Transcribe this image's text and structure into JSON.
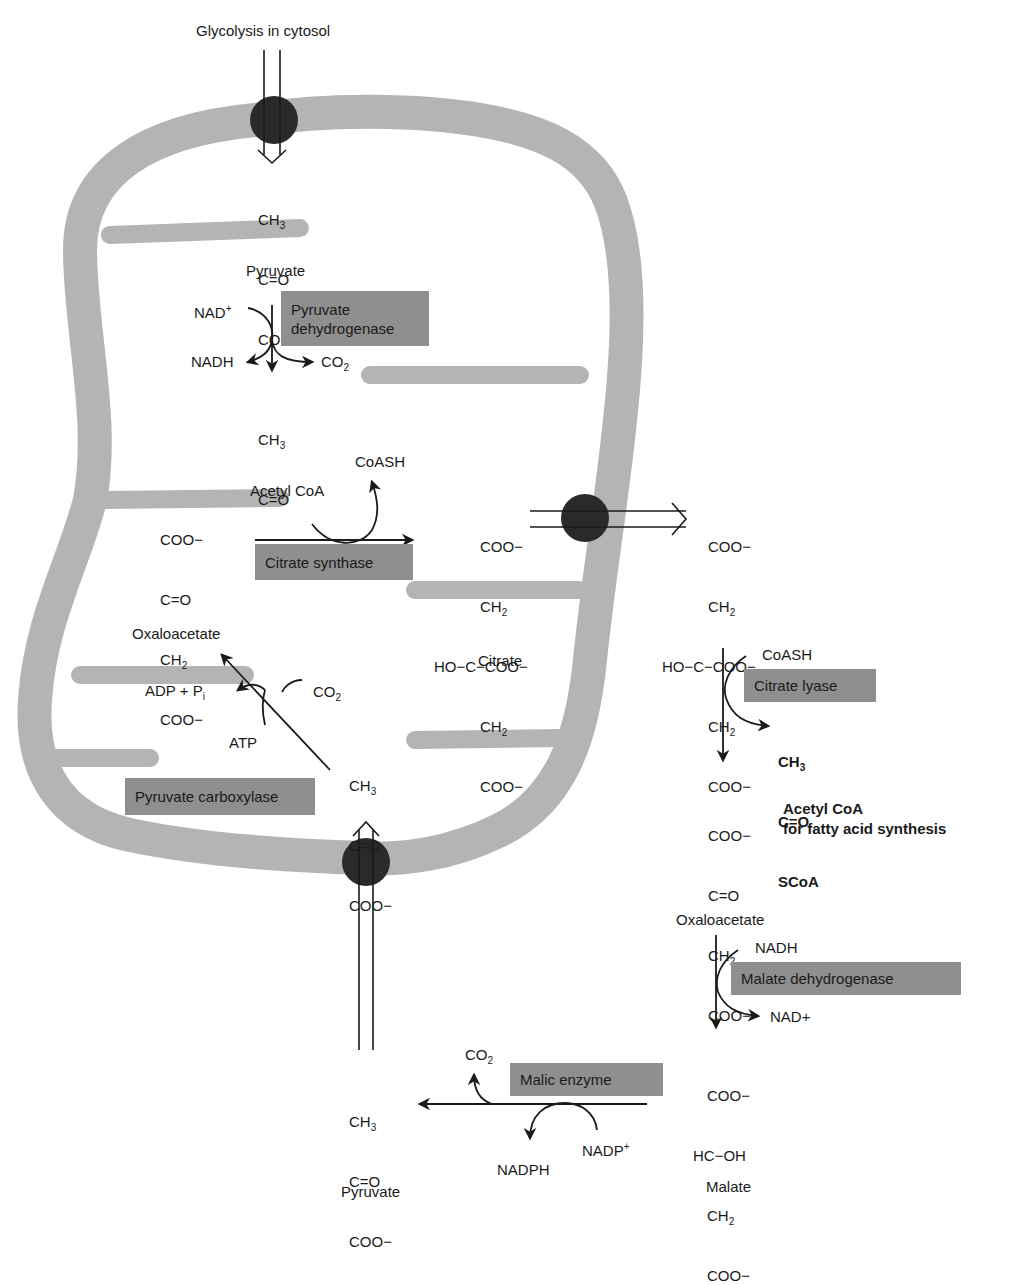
{
  "title": "Glycolysis in cytosol",
  "colors": {
    "membrane": "#b4b4b4",
    "transporter": "#2a2a2a",
    "enzyme_box": "#8f8f8f",
    "text": "#1a1a1a"
  },
  "molecules": {
    "pyruvate_top": {
      "rows": [
        "CH3",
        "C=O",
        "COO−"
      ],
      "name": "Pyruvate"
    },
    "acetyl_coa_matrix": {
      "rows": [
        "CH3",
        "C=O",
        "SCoA"
      ],
      "name": "Acetyl CoA"
    },
    "oxaloacetate_matrix": {
      "rows": [
        "COO−",
        "C=O",
        "CH2",
        "COO−"
      ],
      "name": "Oxaloacetate"
    },
    "citrate_matrix": {
      "rows": [
        "COO−",
        "CH2",
        "HO−C−COO−",
        "CH2",
        "COO−"
      ],
      "name": "Citrate"
    },
    "citrate_cytosol": {
      "rows": [
        "COO−",
        "CH2",
        "HO−C−COO−",
        "CH2",
        "COO−"
      ]
    },
    "acetyl_coa_cytosol": {
      "rows": [
        "CH3",
        "C=O",
        "SCoA"
      ],
      "name": "Acetyl CoA",
      "subtitle": "for fatty acid synthesis"
    },
    "oxaloacetate_cytosol": {
      "rows": [
        "COO−",
        "C=O",
        "CH2",
        "COO−"
      ],
      "name": "Oxaloacetate"
    },
    "malate": {
      "rows": [
        "COO−",
        "HC−OH",
        "CH2",
        "COO−"
      ],
      "name": "Malate"
    },
    "pyruvate_cytosol": {
      "rows": [
        "CH3",
        "C=O",
        "COO−"
      ],
      "name": "Pyruvate"
    },
    "pyruvate_matrix_bottom": {
      "rows": [
        "CH3",
        "C=O",
        "COO−"
      ]
    }
  },
  "enzymes": {
    "pyruvate_dehydrogenase": {
      "line1": "Pyruvate",
      "line2": "dehydrogenase"
    },
    "citrate_synthase": "Citrate synthase",
    "pyruvate_carboxylase": "Pyruvate carboxylase",
    "citrate_lyase": "Citrate lyase",
    "malate_dehydrogenase": "Malate dehydrogenase",
    "malic_enzyme": "Malic enzyme"
  },
  "cofactors": {
    "nad_plus": "NAD",
    "nad_plus_sup": "+",
    "nadh_1": "NADH",
    "co2_1": "CO",
    "co2_sub": "2",
    "coash_1": "CoASH",
    "adp_pi": "ADP + P",
    "pi_sub": "i",
    "atp": "ATP",
    "co2_2": "CO",
    "coash_2": "CoASH",
    "nadh_2": "NADH",
    "nad_plus_2": "NAD+",
    "co2_3": "CO",
    "nadph": "NADPH",
    "nadp_plus": "NADP",
    "nadp_sup": "+"
  }
}
